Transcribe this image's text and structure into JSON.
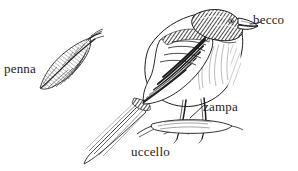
{
  "figure": {
    "background_color": "#ffffff",
    "ink_color": "#1c1c1c",
    "width": 298,
    "height": 171,
    "style": "pen-and-ink engraving",
    "language": "it"
  },
  "labels": {
    "penna": "penna",
    "becco": "becco",
    "zampa": "zampa",
    "uccello": "uccello"
  },
  "objects": {
    "feather": "feather-illustration",
    "bird": "bird-illustration",
    "beak": "beak-part",
    "foot": "foot-part",
    "branch": "branch-perch",
    "tail": "tail-part",
    "wing": "wing-part"
  },
  "leaders": {
    "becco": "leader-line-becco",
    "zampa": "leader-line-zampa"
  }
}
